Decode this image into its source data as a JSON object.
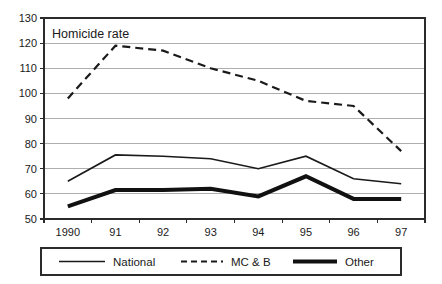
{
  "chart_data": {
    "type": "line",
    "title": "Homicide rate",
    "xlabel": "",
    "ylabel": "",
    "ylim": [
      50,
      130
    ],
    "ytick_step": 10,
    "yticks": [
      50,
      60,
      70,
      80,
      90,
      100,
      110,
      120,
      130
    ],
    "grid": true,
    "grid_axis": "y",
    "legend_position": "bottom",
    "categories": [
      "1990",
      "91",
      "92",
      "93",
      "94",
      "95",
      "96",
      "97"
    ],
    "series": [
      {
        "name": "National",
        "style": "solid-thin",
        "color": "#1a1a1a",
        "values": [
          65,
          75.5,
          75,
          74,
          70,
          75,
          66,
          64
        ]
      },
      {
        "name": "MC & B",
        "style": "dashed",
        "color": "#1a1a1a",
        "values": [
          98,
          119,
          117,
          110,
          105,
          97,
          95,
          77
        ]
      },
      {
        "name": "Other",
        "style": "solid-thick",
        "color": "#111111",
        "values": [
          55,
          61.5,
          61.5,
          62,
          59,
          67,
          58,
          58
        ]
      }
    ]
  },
  "legend": {
    "entries": [
      {
        "label": "National"
      },
      {
        "label": "MC & B"
      },
      {
        "label": "Other"
      }
    ]
  }
}
